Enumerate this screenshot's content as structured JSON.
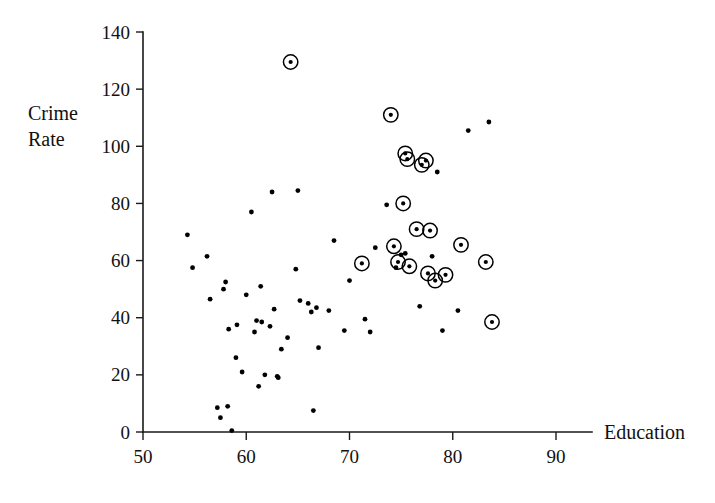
{
  "chart_data": {
    "type": "scatter",
    "title": "",
    "xlabel": "Education",
    "ylabel": "Crime Rate",
    "ylabel_line1": "Crime",
    "ylabel_line2": "Rate",
    "xlim": [
      50,
      90
    ],
    "ylim": [
      0,
      140
    ],
    "xticks": [
      50,
      60,
      70,
      80,
      90
    ],
    "yticks": [
      0,
      20,
      40,
      60,
      80,
      100,
      120,
      140
    ],
    "grid": false,
    "legend": "none",
    "marker_plain": "filled-dot",
    "marker_highlight": "filled-dot-with-open-circle",
    "series": [
      {
        "name": "Unhighlighted counties",
        "marker": "dot",
        "points": [
          [
            54.3,
            69.0
          ],
          [
            54.8,
            57.5
          ],
          [
            56.2,
            61.5
          ],
          [
            56.5,
            46.5
          ],
          [
            57.2,
            8.5
          ],
          [
            57.5,
            5.0
          ],
          [
            57.8,
            50.0
          ],
          [
            58.0,
            52.5
          ],
          [
            58.2,
            9.0
          ],
          [
            58.3,
            36.0
          ],
          [
            58.6,
            0.5
          ],
          [
            59.0,
            26.0
          ],
          [
            59.1,
            37.5
          ],
          [
            59.6,
            21.0
          ],
          [
            60.0,
            48.0
          ],
          [
            60.5,
            77.0
          ],
          [
            60.8,
            35.0
          ],
          [
            61.0,
            39.0
          ],
          [
            61.2,
            16.0
          ],
          [
            61.4,
            51.0
          ],
          [
            61.5,
            38.5
          ],
          [
            61.8,
            20.0
          ],
          [
            62.3,
            37.0
          ],
          [
            62.5,
            84.0
          ],
          [
            62.7,
            43.0
          ],
          [
            63.0,
            19.5
          ],
          [
            63.1,
            19.0
          ],
          [
            63.4,
            29.0
          ],
          [
            64.0,
            33.0
          ],
          [
            64.8,
            57.0
          ],
          [
            65.0,
            84.5
          ],
          [
            65.2,
            46.0
          ],
          [
            66.0,
            45.0
          ],
          [
            66.3,
            42.0
          ],
          [
            66.5,
            7.5
          ],
          [
            66.8,
            43.5
          ],
          [
            67.0,
            29.5
          ],
          [
            68.0,
            42.5
          ],
          [
            68.5,
            67.0
          ],
          [
            69.5,
            35.5
          ],
          [
            70.0,
            53.0
          ],
          [
            71.5,
            39.5
          ],
          [
            72.0,
            35.0
          ],
          [
            72.5,
            64.5
          ],
          [
            73.6,
            79.5
          ],
          [
            74.5,
            57.5
          ],
          [
            75.0,
            62.0
          ],
          [
            75.4,
            62.5
          ],
          [
            76.8,
            44.0
          ],
          [
            78.0,
            61.5
          ],
          [
            78.5,
            91.0
          ],
          [
            79.0,
            35.5
          ],
          [
            80.5,
            42.5
          ],
          [
            81.5,
            105.5
          ],
          [
            83.5,
            108.5
          ]
        ]
      },
      {
        "name": "Highlighted counties",
        "marker": "dot-with-circle",
        "points": [
          [
            64.3,
            129.5
          ],
          [
            71.2,
            59.0
          ],
          [
            74.0,
            111.0
          ],
          [
            74.3,
            65.0
          ],
          [
            74.7,
            59.5
          ],
          [
            75.2,
            80.0
          ],
          [
            75.4,
            97.5
          ],
          [
            75.6,
            95.5
          ],
          [
            75.8,
            58.0
          ],
          [
            76.5,
            71.0
          ],
          [
            77.0,
            93.5
          ],
          [
            77.4,
            95.0
          ],
          [
            77.6,
            55.5
          ],
          [
            77.8,
            70.5
          ],
          [
            78.3,
            53.0
          ],
          [
            79.3,
            55.0
          ],
          [
            80.8,
            65.5
          ],
          [
            83.2,
            59.5
          ],
          [
            83.8,
            38.5
          ]
        ]
      }
    ]
  },
  "axes": {
    "x_axis_name": "education-axis",
    "y_axis_name": "crime-rate-axis"
  }
}
